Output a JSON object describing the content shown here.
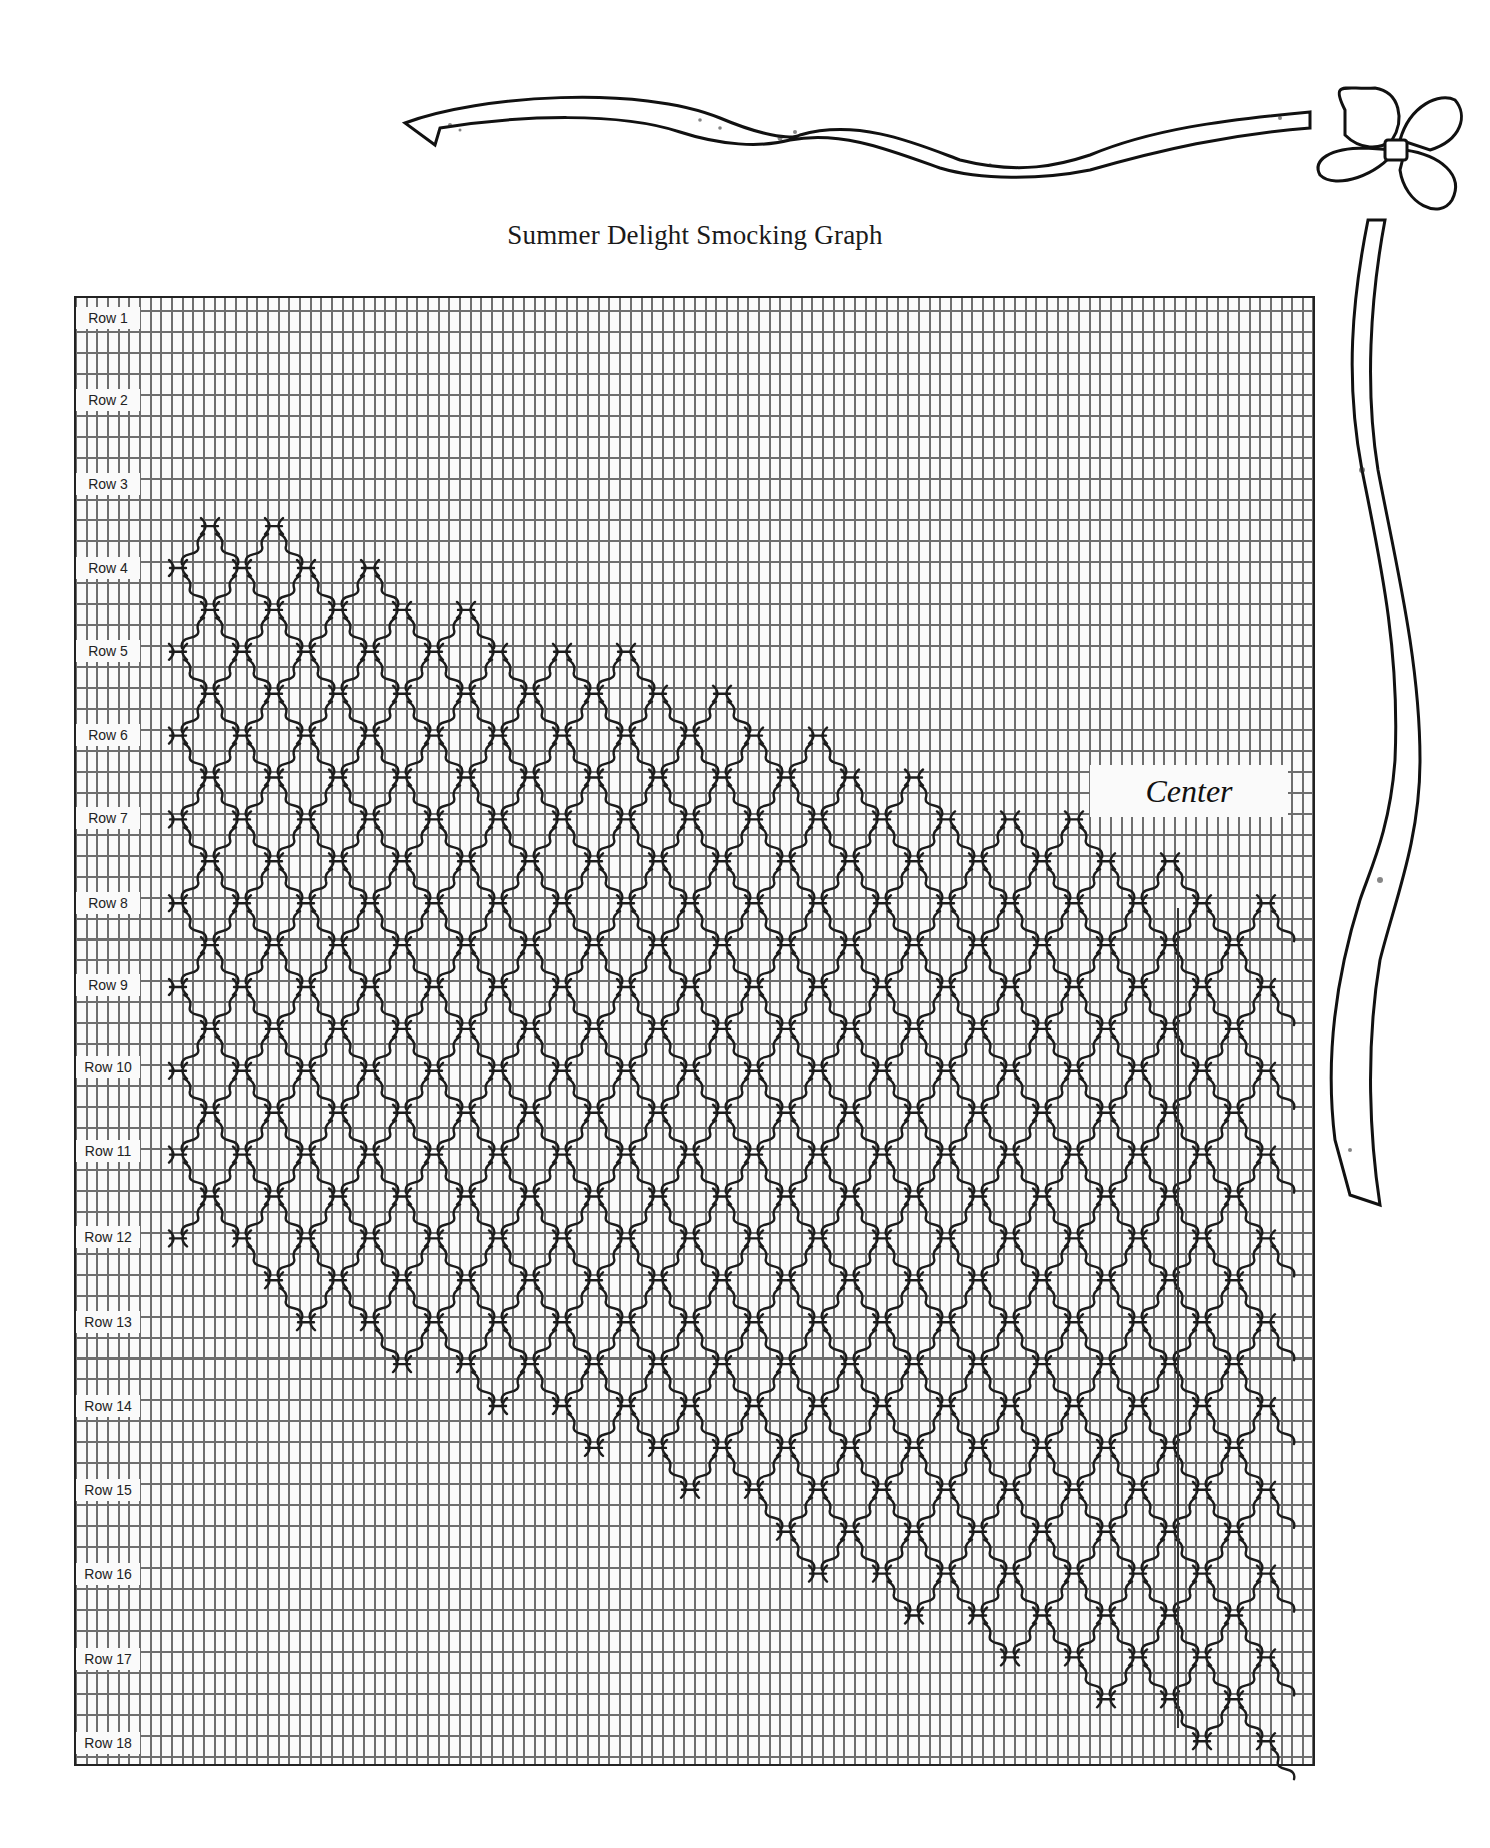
{
  "title": "Summer Delight Smocking Graph",
  "center_label": "Center",
  "rows": [
    {
      "label": "Row 1",
      "y": 318
    },
    {
      "label": "Row 2",
      "y": 400
    },
    {
      "label": "Row 3",
      "y": 484
    },
    {
      "label": "Row 4",
      "y": 568
    },
    {
      "label": "Row 5",
      "y": 651
    },
    {
      "label": "Row 6",
      "y": 735
    },
    {
      "label": "Row 7",
      "y": 818
    },
    {
      "label": "Row 8",
      "y": 903
    },
    {
      "label": "Row 9",
      "y": 985
    },
    {
      "label": "Row 10",
      "y": 1067
    },
    {
      "label": "Row 11",
      "y": 1151
    },
    {
      "label": "Row 12",
      "y": 1237
    },
    {
      "label": "Row 13",
      "y": 1322
    },
    {
      "label": "Row 14",
      "y": 1406
    },
    {
      "label": "Row 15",
      "y": 1490
    },
    {
      "label": "Row 16",
      "y": 1574
    },
    {
      "label": "Row 17",
      "y": 1659
    },
    {
      "label": "Row 18",
      "y": 1743
    }
  ],
  "pattern": {
    "x0": 178,
    "dx": 32,
    "y0": 568,
    "dy": 41.9,
    "top_start": [
      178,
      500
    ],
    "top_slope": 0.36,
    "bottom_start": [
      178,
      1250
    ],
    "bottom_slope": 0.49,
    "x_max": 1286,
    "stitch_color": "#1c1c1c"
  },
  "decoration": "ribbon-and-bow"
}
